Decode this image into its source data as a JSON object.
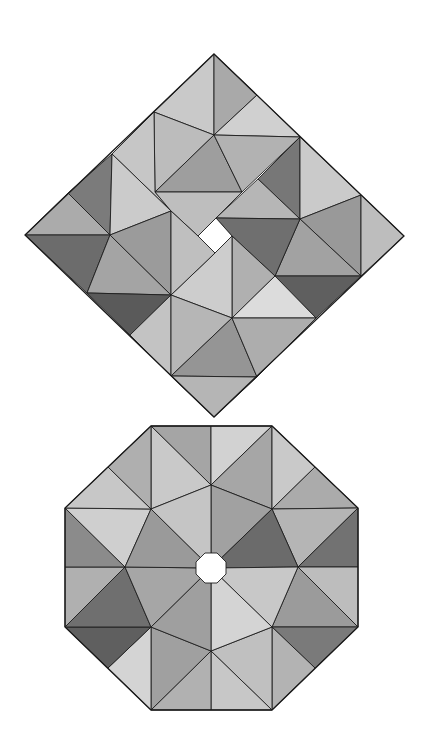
{
  "diagram": {
    "background": "#ffffff",
    "stroke_color": "#1e1e1e",
    "shapes": [
      {
        "id": "square",
        "description": "square tiled by triangles in a pinwheel arrangement, rotated 45 degrees, with small square hole in the center",
        "points": {
          "T": [
            214,
            54
          ],
          "L": [
            25,
            235
          ],
          "R": [
            404,
            236
          ],
          "B": [
            214,
            417
          ],
          "A": [
            154,
            112
          ],
          "C": [
            257,
            95
          ],
          "P1": [
            214,
            135
          ],
          "D": [
            300,
            137
          ],
          "E": [
            155,
            192
          ],
          "F": [
            242,
            192
          ],
          "G": [
            112,
            154
          ],
          "H": [
            68,
            193
          ],
          "J": [
            110,
            235
          ],
          "K": [
            171,
            211
          ],
          "Z": [
            258,
            179
          ],
          "X": [
            300,
            219
          ],
          "AA": [
            361,
            195
          ],
          "BB": [
            361,
            276
          ],
          "U": [
            275,
            276
          ],
          "W": [
            316,
            318
          ],
          "S": [
            232,
            318
          ],
          "M": [
            171,
            295
          ],
          "N": [
            87,
            293
          ],
          "Q": [
            130,
            335
          ],
          "V": [
            171,
            376
          ],
          "Y": [
            257,
            377
          ],
          "hT": [
            216,
            218
          ],
          "hR": [
            232,
            236
          ],
          "hB": [
            215,
            253
          ],
          "hL": [
            198,
            236
          ]
        },
        "outline": [
          "T",
          "R",
          "B",
          "L"
        ],
        "hole": [
          "hT",
          "hR",
          "hB",
          "hL"
        ],
        "tiles": [
          {
            "pts": [
              "T",
              "A",
              "P1"
            ],
            "fill": "#c9c9c9"
          },
          {
            "pts": [
              "T",
              "C",
              "P1"
            ],
            "fill": "#a9a9a9"
          },
          {
            "pts": [
              "C",
              "D",
              "P1"
            ],
            "fill": "#d0d0d0"
          },
          {
            "pts": [
              "A",
              "P1",
              "E"
            ],
            "fill": "#bcbcbc"
          },
          {
            "pts": [
              "P1",
              "E",
              "F"
            ],
            "fill": "#9e9e9e"
          },
          {
            "pts": [
              "P1",
              "D",
              "F"
            ],
            "fill": "#b2b2b2"
          },
          {
            "pts": [
              "A",
              "G",
              "K",
              "E"
            ],
            "fill": "#c6c6c6"
          },
          {
            "pts": [
              "E",
              "F",
              "hT",
              "hL",
              "K"
            ],
            "fill": "#bebebe"
          },
          {
            "pts": [
              "D",
              "Z",
              "X"
            ],
            "fill": "#777777"
          },
          {
            "pts": [
              "Z",
              "X",
              "hT"
            ],
            "fill": "#b6b6b6"
          },
          {
            "pts": [
              "D",
              "AA",
              "X"
            ],
            "fill": "#cacaca"
          },
          {
            "pts": [
              "X",
              "AA",
              "BB"
            ],
            "fill": "#999999"
          },
          {
            "pts": [
              "AA",
              "R",
              "BB"
            ],
            "fill": "#bdbdbd"
          },
          {
            "pts": [
              "X",
              "U",
              "BB"
            ],
            "fill": "#a2a2a2"
          },
          {
            "pts": [
              "hT",
              "X",
              "U",
              "hR"
            ],
            "fill": "#6f6f6f"
          },
          {
            "pts": [
              "U",
              "BB",
              "W"
            ],
            "fill": "#5f5f5f"
          },
          {
            "pts": [
              "hR",
              "U",
              "S"
            ],
            "fill": "#b0b0b0"
          },
          {
            "pts": [
              "S",
              "U",
              "W"
            ],
            "fill": "#dcdcdc"
          },
          {
            "pts": [
              "hB",
              "hR",
              "S",
              "M"
            ],
            "fill": "#cdcdcd"
          },
          {
            "pts": [
              "G",
              "H",
              "J"
            ],
            "fill": "#7b7b7b"
          },
          {
            "pts": [
              "G",
              "J",
              "K"
            ],
            "fill": "#cbcbcb"
          },
          {
            "pts": [
              "H",
              "L",
              "J"
            ],
            "fill": "#ababab"
          },
          {
            "pts": [
              "L",
              "J",
              "N"
            ],
            "fill": "#6c6c6c"
          },
          {
            "pts": [
              "J",
              "N",
              "M"
            ],
            "fill": "#a4a4a4"
          },
          {
            "pts": [
              "J",
              "K",
              "M"
            ],
            "fill": "#9b9b9b"
          },
          {
            "pts": [
              "K",
              "hL",
              "hB",
              "M"
            ],
            "fill": "#bfbfbf"
          },
          {
            "pts": [
              "N",
              "M",
              "Q"
            ],
            "fill": "#5a5a5a"
          },
          {
            "pts": [
              "M",
              "Q",
              "V"
            ],
            "fill": "#c3c3c3"
          },
          {
            "pts": [
              "M",
              "S",
              "V"
            ],
            "fill": "#b6b6b6"
          },
          {
            "pts": [
              "S",
              "V",
              "Y"
            ],
            "fill": "#959595"
          },
          {
            "pts": [
              "S",
              "Y",
              "W"
            ],
            "fill": "#adadad"
          },
          {
            "pts": [
              "V",
              "Y",
              "B"
            ],
            "fill": "#b5b5b5"
          }
        ]
      },
      {
        "id": "octagon",
        "description": "regular octagon tiled by triangles around a small octagonal central hole",
        "points": {
          "O1": [
            151,
            426
          ],
          "O2": [
            272,
            426
          ],
          "O3": [
            358,
            508
          ],
          "O4": [
            358,
            627
          ],
          "O5": [
            272,
            710
          ],
          "O6": [
            151,
            710
          ],
          "O7": [
            65,
            627
          ],
          "O8": [
            65,
            508
          ],
          "MT": [
            211,
            426
          ],
          "MNE": [
            315,
            467
          ],
          "MR": [
            358,
            567
          ],
          "MSE": [
            315,
            668
          ],
          "MB": [
            211,
            710
          ],
          "MSW": [
            108,
            668
          ],
          "ML": [
            65,
            567
          ],
          "MNW": [
            108,
            467
          ],
          "I0": [
            211,
            485
          ],
          "I1": [
            272,
            509
          ],
          "I2": [
            298,
            567
          ],
          "I3": [
            272,
            627
          ],
          "I4": [
            211,
            651
          ],
          "I5": [
            151,
            627
          ],
          "I6": [
            125,
            567
          ],
          "I7": [
            151,
            509
          ],
          "Ctr": [
            211,
            568
          ],
          "h1": [
            226,
            562
          ],
          "h2": [
            217,
            553
          ],
          "h3": [
            205,
            553
          ],
          "h4": [
            196,
            562
          ],
          "h5": [
            196,
            574
          ],
          "h6": [
            205,
            583
          ],
          "h7": [
            217,
            583
          ],
          "h8": [
            226,
            574
          ]
        },
        "outline": [
          "O1",
          "O2",
          "O3",
          "O4",
          "O5",
          "O6",
          "O7",
          "O8"
        ],
        "hole": [
          "h1",
          "h2",
          "h3",
          "h4",
          "h5",
          "h6",
          "h7",
          "h8"
        ],
        "tiles": [
          {
            "pts": [
              "O1",
              "MT",
              "I0"
            ],
            "fill": "#a5a5a5"
          },
          {
            "pts": [
              "O1",
              "I0",
              "I7"
            ],
            "fill": "#c9c9c9"
          },
          {
            "pts": [
              "MT",
              "O2",
              "I0"
            ],
            "fill": "#d2d2d2"
          },
          {
            "pts": [
              "O2",
              "I0",
              "I1"
            ],
            "fill": "#a6a6a6"
          },
          {
            "pts": [
              "O2",
              "MNE",
              "I1"
            ],
            "fill": "#c9c9c9"
          },
          {
            "pts": [
              "MNE",
              "O3",
              "I1"
            ],
            "fill": "#ababab"
          },
          {
            "pts": [
              "O3",
              "I1",
              "I2"
            ],
            "fill": "#b5b5b5"
          },
          {
            "pts": [
              "O3",
              "MR",
              "I2"
            ],
            "fill": "#727272"
          },
          {
            "pts": [
              "MR",
              "O4",
              "I2"
            ],
            "fill": "#bdbdbd"
          },
          {
            "pts": [
              "O4",
              "I2",
              "I3"
            ],
            "fill": "#9b9b9b"
          },
          {
            "pts": [
              "O4",
              "MSE",
              "I3"
            ],
            "fill": "#7a7a7a"
          },
          {
            "pts": [
              "MSE",
              "O5",
              "I3"
            ],
            "fill": "#b3b3b3"
          },
          {
            "pts": [
              "O5",
              "I3",
              "I4"
            ],
            "fill": "#c0c0c0"
          },
          {
            "pts": [
              "O5",
              "MB",
              "I4"
            ],
            "fill": "#c7c7c7"
          },
          {
            "pts": [
              "MB",
              "O6",
              "I4"
            ],
            "fill": "#b1b1b1"
          },
          {
            "pts": [
              "O6",
              "I4",
              "I5"
            ],
            "fill": "#a0a0a0"
          },
          {
            "pts": [
              "O6",
              "MSW",
              "I5"
            ],
            "fill": "#d4d4d4"
          },
          {
            "pts": [
              "MSW",
              "O7",
              "I5"
            ],
            "fill": "#5f5f5f"
          },
          {
            "pts": [
              "O7",
              "I5",
              "I6"
            ],
            "fill": "#6f6f6f"
          },
          {
            "pts": [
              "O7",
              "ML",
              "I6"
            ],
            "fill": "#b0b0b0"
          },
          {
            "pts": [
              "ML",
              "O8",
              "I6"
            ],
            "fill": "#8b8b8b"
          },
          {
            "pts": [
              "O8",
              "I6",
              "I7"
            ],
            "fill": "#cfcfcf"
          },
          {
            "pts": [
              "O8",
              "MNW",
              "I7"
            ],
            "fill": "#c7c7c7"
          },
          {
            "pts": [
              "MNW",
              "O1",
              "I7"
            ],
            "fill": "#afafaf"
          },
          {
            "pts": [
              "I0",
              "I1",
              "Ctr"
            ],
            "fill": "#a1a1a1"
          },
          {
            "pts": [
              "I1",
              "I2",
              "Ctr"
            ],
            "fill": "#6b6b6b"
          },
          {
            "pts": [
              "I2",
              "I3",
              "Ctr"
            ],
            "fill": "#c8c8c8"
          },
          {
            "pts": [
              "I3",
              "I4",
              "Ctr"
            ],
            "fill": "#d4d4d4"
          },
          {
            "pts": [
              "I4",
              "I5",
              "Ctr"
            ],
            "fill": "#9f9f9f"
          },
          {
            "pts": [
              "I5",
              "I6",
              "Ctr"
            ],
            "fill": "#a6a6a6"
          },
          {
            "pts": [
              "I6",
              "I7",
              "Ctr"
            ],
            "fill": "#9a9a9a"
          },
          {
            "pts": [
              "I7",
              "I0",
              "Ctr"
            ],
            "fill": "#c5c5c5"
          }
        ]
      }
    ]
  }
}
